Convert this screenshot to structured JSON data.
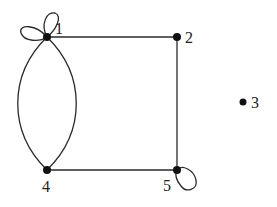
{
  "diagram": {
    "type": "graph",
    "nodes": [
      {
        "id": "1",
        "label": "1",
        "x": 47,
        "y": 37
      },
      {
        "id": "2",
        "label": "2",
        "x": 177,
        "y": 37
      },
      {
        "id": "3",
        "label": "3",
        "x": 243,
        "y": 102
      },
      {
        "id": "4",
        "label": "4",
        "x": 47,
        "y": 170
      },
      {
        "id": "5",
        "label": "5",
        "x": 177,
        "y": 170
      }
    ],
    "edges": [
      {
        "from": "1",
        "to": "2",
        "kind": "straight"
      },
      {
        "from": "2",
        "to": "5",
        "kind": "straight"
      },
      {
        "from": "4",
        "to": "5",
        "kind": "straight"
      },
      {
        "from": "1",
        "to": "4",
        "kind": "curved-left"
      },
      {
        "from": "1",
        "to": "4",
        "kind": "curved-right"
      },
      {
        "from": "1",
        "to": "1",
        "kind": "loop-left"
      },
      {
        "from": "1",
        "to": "1",
        "kind": "loop-up"
      },
      {
        "from": "5",
        "to": "5",
        "kind": "loop-down-right"
      }
    ],
    "colors": {
      "edge": "#2a2a2a",
      "node": "#111111",
      "label": "#222222",
      "background": "#ffffff"
    }
  }
}
